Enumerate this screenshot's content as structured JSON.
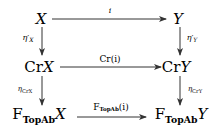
{
  "diagram": {
    "type": "commutative-square",
    "nodes": {
      "x": {
        "text": "X"
      },
      "y": {
        "text": "Y"
      },
      "crx": {
        "prefix": "Cr",
        "var": "X"
      },
      "cry": {
        "prefix": "Cr",
        "var": "Y"
      },
      "fx": {
        "prefix": "F",
        "sub": "TopAb",
        "var": "X"
      },
      "fy": {
        "prefix": "F",
        "sub": "TopAb",
        "var": "Y"
      }
    },
    "edges": {
      "top": {
        "from": "X",
        "to": "Y",
        "label": "i"
      },
      "middle": {
        "from": "CrX",
        "to": "CrY",
        "label": "Cr(i)"
      },
      "bottom": {
        "from": "F_TopAb X",
        "to": "F_TopAb Y",
        "label_prefix": "F",
        "label_sub": "TopAb",
        "label_arg": "(i)"
      },
      "left_upper": {
        "from": "X",
        "to": "CrX",
        "label_sym": "η′",
        "label_sub": "X"
      },
      "right_upper": {
        "from": "Y",
        "to": "CrY",
        "label_sym": "η′",
        "label_sub": "Y"
      },
      "left_lower": {
        "from": "CrX",
        "to": "F_TopAb X",
        "label_sym": "η",
        "label_sub": "CrX"
      },
      "right_lower": {
        "from": "CrY",
        "to": "F_TopAb Y",
        "label_sym": "η",
        "label_sub": "CrY"
      }
    }
  }
}
